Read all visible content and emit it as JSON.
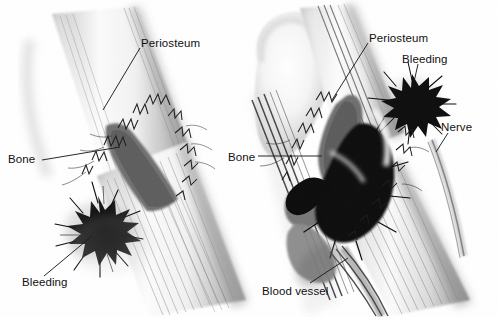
{
  "figure": {
    "kind": "medical-illustration",
    "background_color": "#ffffff",
    "ink_color": "#111111",
    "panels": [
      {
        "id": "left-panel",
        "name": "simple-fracture",
        "labels": [
          "Periosteum",
          "Bone",
          "Bleeding"
        ]
      },
      {
        "id": "right-panel",
        "name": "compound-fracture",
        "labels": [
          "Periosteum",
          "Bleeding",
          "Nerve",
          "Bone",
          "Blood vessel"
        ]
      }
    ]
  },
  "labels": {
    "left_periosteum": "Periosteum",
    "left_bone": "Bone",
    "left_bleeding": "Bleeding",
    "right_periosteum": "Periosteum",
    "right_bleeding": "Bleeding",
    "right_nerve": "Nerve",
    "right_bone": "Bone",
    "right_blood_vessel": "Blood vessel"
  },
  "palette": {
    "bone_highlight": "#fdfdfd",
    "bone_midtone": "#c9c9c9",
    "bone_shadow": "#8d8d8d",
    "fracture_fill": "#6a6a6a",
    "hematoma": "#141414",
    "leader_line": "#1a1a1a"
  }
}
